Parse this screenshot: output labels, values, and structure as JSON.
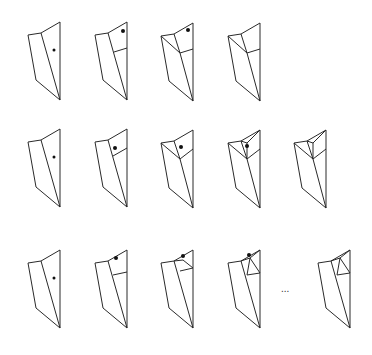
{
  "figure": {
    "stroke_color": "#2a2a2a",
    "dot_color": "#111111",
    "ellipsis_label": "...",
    "rows": [
      {
        "id": "row-1",
        "panels": [
          {
            "origin": [
              28,
              35
            ],
            "stage": "base",
            "dot": [
              26,
              15
            ],
            "dot_r": 1.5
          },
          {
            "origin": [
              95,
              35
            ],
            "stage": "split-right",
            "dot": [
              28,
              -4
            ],
            "dot_r": 2
          },
          {
            "origin": [
              161,
              36
            ],
            "stage": "diagonal-fold",
            "dot": [
              27,
              -6
            ],
            "dot_r": 2
          },
          {
            "origin": [
              228,
              36
            ],
            "stage": "diagonal-fold-final",
            "dot": null
          }
        ]
      },
      {
        "id": "row-2",
        "panels": [
          {
            "origin": [
              28,
              142
            ],
            "stage": "base",
            "dot": [
              26,
              15
            ],
            "dot_r": 1.5
          },
          {
            "origin": [
              95,
              142
            ],
            "stage": "split-right-low",
            "dot": [
              20,
              6
            ],
            "dot_r": 2
          },
          {
            "origin": [
              161,
              143
            ],
            "stage": "diagonal-fold-low",
            "dot": [
              20,
              4
            ],
            "dot_r": 2
          },
          {
            "origin": [
              228,
              143
            ],
            "stage": "inner-fold",
            "dot": [
              19,
              3
            ],
            "dot_r": 2
          },
          {
            "origin": [
              294,
              143
            ],
            "stage": "inner-fold-final",
            "dot": null
          }
        ]
      },
      {
        "id": "row-3",
        "panels": [
          {
            "origin": [
              28,
              263
            ],
            "stage": "base",
            "dot": [
              26,
              15
            ],
            "dot_r": 1.5
          },
          {
            "origin": [
              95,
              263
            ],
            "stage": "split-right-high",
            "dot": [
              21,
              -5
            ],
            "dot_r": 2
          },
          {
            "origin": [
              161,
              263
            ],
            "stage": "top-triangle",
            "dot": [
              22,
              -7
            ],
            "dot_r": 2
          },
          {
            "origin": [
              228,
              263
            ],
            "stage": "top-triangle-nested",
            "dot": [
              21,
              -8
            ],
            "dot_r": 2
          },
          {
            "origin": [
              318,
              263
            ],
            "stage": "top-triangle-nested-final",
            "dot": null
          }
        ]
      }
    ]
  }
}
